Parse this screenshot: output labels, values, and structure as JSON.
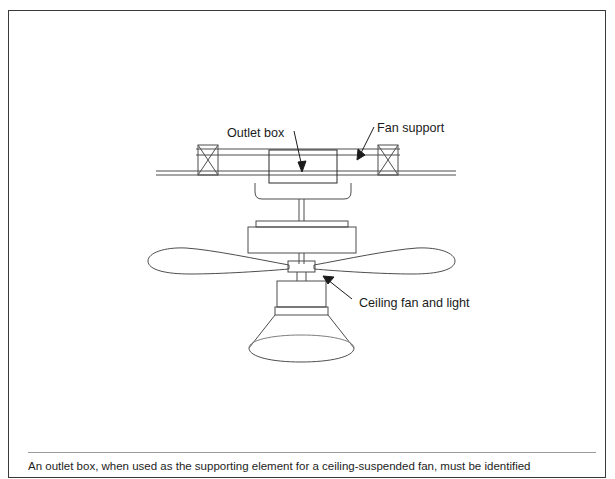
{
  "document": {
    "caption": "An outlet box, when used as the supporting element for a ceiling-suspended fan, must be identified",
    "border_color": "#3a3a3a",
    "rule_color": "#9a9a9a"
  },
  "figure": {
    "line_color": "#4d4d4d",
    "heavy_line_color": "#2b2b2b",
    "labels": [
      {
        "id": "outlet-box",
        "text": "Outlet box",
        "x": 219,
        "y": 127,
        "leader": {
          "x1": 286,
          "y1": 121,
          "x2": 294,
          "y2": 160
        }
      },
      {
        "id": "fan-support",
        "text": "Fan support",
        "x": 369,
        "y": 122,
        "leader": {
          "x1": 366,
          "y1": 117,
          "x2": 351,
          "y2": 148
        }
      },
      {
        "id": "ceiling-fan-and-light",
        "text": "Ceiling fan and light",
        "x": 351,
        "y": 297,
        "leader": {
          "x1": 344,
          "y1": 289,
          "x2": 316,
          "y2": 266
        }
      }
    ],
    "parts": [
      {
        "id": "ceiling-line",
        "name": "ceiling plane"
      },
      {
        "id": "joist-left",
        "name": "left ceiling joist"
      },
      {
        "id": "joist-right",
        "name": "right ceiling joist"
      },
      {
        "id": "support-bar",
        "name": "fan support bar"
      },
      {
        "id": "outlet-box-body",
        "name": "outlet box"
      },
      {
        "id": "canopy",
        "name": "fan canopy bracket"
      },
      {
        "id": "downrod",
        "name": "downrod"
      },
      {
        "id": "motor-housing",
        "name": "fan motor housing"
      },
      {
        "id": "blade-left",
        "name": "left fan blade"
      },
      {
        "id": "blade-right",
        "name": "right fan blade"
      },
      {
        "id": "hub",
        "name": "blade hub"
      },
      {
        "id": "light-neck",
        "name": "light fitter"
      },
      {
        "id": "light-shade",
        "name": "light shade"
      }
    ]
  }
}
